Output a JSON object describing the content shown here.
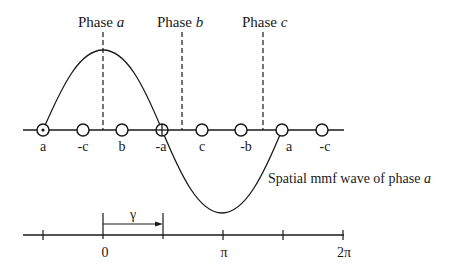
{
  "diagram": {
    "phase_labels": [
      {
        "prefix": "Phase",
        "phase": "a",
        "x": 103
      },
      {
        "prefix": "Phase",
        "phase": "b",
        "x": 182
      },
      {
        "prefix": "Phase",
        "phase": "c",
        "x": 263
      }
    ],
    "conductors": [
      {
        "label": "a",
        "x": 43,
        "symbol": "dot"
      },
      {
        "label": "-c",
        "x": 83,
        "symbol": "none"
      },
      {
        "label": "b",
        "x": 122,
        "symbol": "none"
      },
      {
        "label": "-a",
        "x": 162,
        "symbol": "cross"
      },
      {
        "label": "c",
        "x": 202,
        "symbol": "none"
      },
      {
        "label": "-b",
        "x": 241,
        "symbol": "none"
      },
      {
        "label": "a",
        "x": 282,
        "symbol": "none"
      },
      {
        "label": "-c",
        "x": 322,
        "symbol": "none"
      }
    ],
    "wave_label_prefix": "Spatial mmf wave of phase",
    "wave_label_phase": "a",
    "angle_axis": {
      "ticks": [
        "",
        "0",
        "",
        "π",
        "",
        "2π"
      ],
      "gamma_label": "γ"
    },
    "colors": {
      "line": "#1a1a1a",
      "background": "#ffffff"
    }
  }
}
